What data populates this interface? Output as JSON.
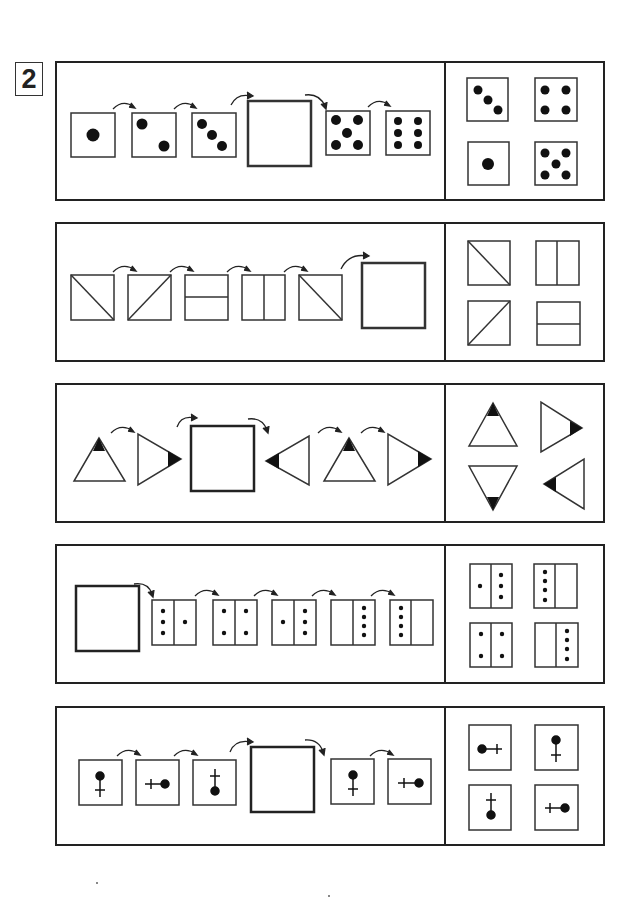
{
  "worksheet": {
    "label": "2",
    "rows": [
      {
        "id": "dice-sequence",
        "sequence": [
          "die-1",
          "die-2",
          "die-3",
          "blank",
          "die-5",
          "die-6"
        ],
        "answer_options": [
          "die-3",
          "die-4",
          "die-1",
          "die-5"
        ]
      },
      {
        "id": "line-split-sequence",
        "sequence": [
          "diag-backslash",
          "diag-slash",
          "horizontal-split",
          "vertical-split",
          "diag-backslash",
          "blank"
        ],
        "answer_options": [
          "diag-backslash",
          "vertical-split",
          "diag-slash",
          "horizontal-split"
        ]
      },
      {
        "id": "triangle-rotation-sequence",
        "sequence": [
          "triangle-up",
          "triangle-right",
          "blank",
          "triangle-left",
          "triangle-up",
          "triangle-right"
        ],
        "answer_options": [
          "triangle-up",
          "triangle-right",
          "triangle-down",
          "triangle-left"
        ]
      },
      {
        "id": "domino-dots-sequence",
        "sequence": [
          "blank",
          "domino-3-1",
          "domino-2-2",
          "domino-1-3",
          "domino-0-4",
          "domino-4-0"
        ],
        "answer_options": [
          "domino-1-3",
          "domino-4-0",
          "domino-2-2",
          "domino-0-4"
        ]
      },
      {
        "id": "pin-rotation-sequence",
        "sequence": [
          "pin-up",
          "pin-right",
          "pin-down",
          "blank",
          "pin-up",
          "pin-right"
        ],
        "answer_options": [
          "pin-left",
          "pin-up",
          "pin-down",
          "pin-right"
        ]
      }
    ]
  },
  "colors": {
    "ink": "#222222",
    "paper": "#ffffff"
  }
}
